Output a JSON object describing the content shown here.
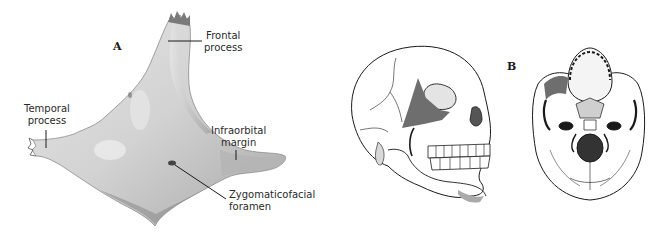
{
  "figure": {
    "panel_a": {
      "letter": "A",
      "subject": "zygomatic-bone-lateral-view",
      "labels": {
        "frontal_process": [
          "Frontal",
          "process"
        ],
        "temporal_process": [
          "Temporal",
          "process"
        ],
        "infraorbital_margin": [
          "Infraorbital",
          "margin"
        ],
        "zygomaticofacial_foramen": [
          "Zygomaticofacial",
          "foramen"
        ]
      }
    },
    "panel_b": {
      "letter": "B",
      "views": [
        "skull-anterolateral-view",
        "skull-inferior-view"
      ],
      "highlight_color": "#6e6e6e"
    },
    "colors": {
      "bone_fill": "#dcdcdc",
      "bone_shadow": "#9a9a9a",
      "line": "#1a1a1a"
    }
  }
}
